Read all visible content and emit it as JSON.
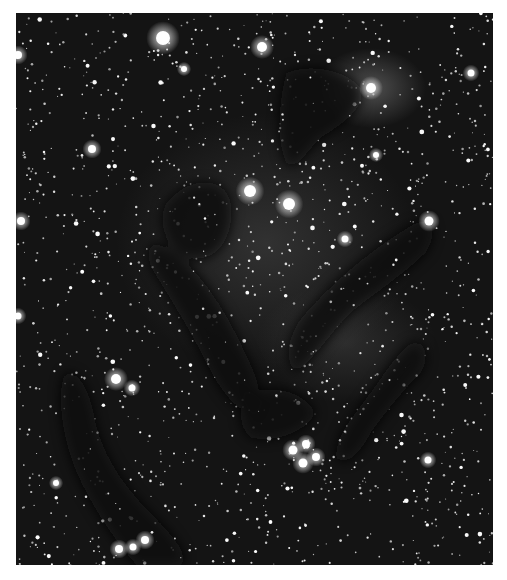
{
  "image": {
    "subject": "Dark nebula pillars in a dense star field (greyscale astrophotograph)",
    "frame": {
      "x": 16,
      "y": 13,
      "width": 477,
      "height": 552
    },
    "background_color": "#ffffff",
    "sky_color": "#141414",
    "glow_regions": [
      {
        "cx": 355,
        "cy": 75,
        "rx": 55,
        "ry": 40,
        "opacity": 0.45
      },
      {
        "cx": 250,
        "cy": 230,
        "rx": 150,
        "ry": 130,
        "opacity": 0.22
      },
      {
        "cx": 330,
        "cy": 330,
        "rx": 90,
        "ry": 60,
        "opacity": 0.18
      }
    ],
    "dark_nebulae": [
      {
        "name": "upper-pillar",
        "d": "M270,60 C290,50 330,55 345,75 C350,95 330,110 305,125 C290,140 280,160 270,150 C260,130 262,90 270,60 Z"
      },
      {
        "name": "central-left-cloud",
        "d": "M180,170 C205,165 220,180 215,210 C210,240 190,250 170,245 C150,235 140,210 150,190 C160,178 170,172 180,170 Z"
      },
      {
        "name": "right-pillar",
        "d": "M405,208 C420,205 420,225 410,240 C390,260 360,280 335,300 C315,320 300,345 280,360 C268,350 270,325 285,305 C310,275 345,245 375,225 C390,215 398,210 405,208 Z"
      },
      {
        "name": "lower-right-pillar",
        "d": "M395,330 C410,325 415,345 405,360 C385,380 370,400 355,420 C345,440 330,455 320,445 C318,425 335,405 350,385 C365,365 380,340 395,330 Z"
      },
      {
        "name": "center-band",
        "d": "M140,230 C170,240 200,280 220,320 C240,360 250,380 240,400 C225,405 205,380 190,350 C170,310 150,280 135,255 C130,240 133,232 140,230 Z"
      },
      {
        "name": "lower-left-pillar",
        "d": "M50,360 C65,358 75,380 80,410 C90,450 115,480 140,505 C160,525 175,545 165,552 L120,552 C100,530 80,500 65,470 C50,440 42,400 45,375 C46,366 48,361 50,360 Z"
      },
      {
        "name": "mid-dark-lane",
        "d": "M230,380 C260,370 290,380 300,400 C290,420 260,430 235,425 C222,415 222,395 230,380 Z"
      }
    ],
    "bright_stars": [
      {
        "x": 147,
        "y": 25,
        "r": 7
      },
      {
        "x": 246,
        "y": 34,
        "r": 5
      },
      {
        "x": 234,
        "y": 178,
        "r": 6
      },
      {
        "x": 273,
        "y": 191,
        "r": 6
      },
      {
        "x": 413,
        "y": 208,
        "r": 4.5
      },
      {
        "x": 355,
        "y": 75,
        "r": 5
      },
      {
        "x": 100,
        "y": 366,
        "r": 5
      },
      {
        "x": 116,
        "y": 375,
        "r": 3.5
      },
      {
        "x": 76,
        "y": 136,
        "r": 4
      },
      {
        "x": 329,
        "y": 226,
        "r": 3.5
      },
      {
        "x": 277,
        "y": 437,
        "r": 4.5
      },
      {
        "x": 290,
        "y": 431,
        "r": 4
      },
      {
        "x": 300,
        "y": 444,
        "r": 4
      },
      {
        "x": 287,
        "y": 450,
        "r": 4.5
      },
      {
        "x": 103,
        "y": 536,
        "r": 4
      },
      {
        "x": 117,
        "y": 534,
        "r": 3.5
      },
      {
        "x": 129,
        "y": 527,
        "r": 4
      },
      {
        "x": 5,
        "y": 208,
        "r": 4
      },
      {
        "x": 2,
        "y": 42,
        "r": 4
      },
      {
        "x": 360,
        "y": 142,
        "r": 3
      },
      {
        "x": 168,
        "y": 56,
        "r": 3
      },
      {
        "x": 455,
        "y": 60,
        "r": 3.5
      },
      {
        "x": 40,
        "y": 470,
        "r": 3
      },
      {
        "x": 412,
        "y": 447,
        "r": 3.5
      },
      {
        "x": 2,
        "y": 303,
        "r": 3.5
      }
    ],
    "star_field": {
      "count": 1400,
      "seed": 7
    }
  }
}
